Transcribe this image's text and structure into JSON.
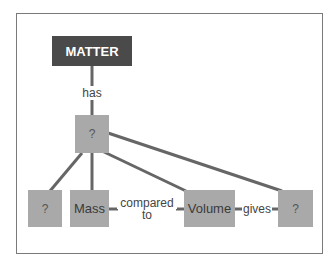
{
  "diagram": {
    "type": "concept-map",
    "nodes": {
      "matter": "MATTER",
      "property": "?",
      "left_unknown": "?",
      "mass": "Mass",
      "volume": "Volume",
      "result": "?"
    },
    "links": {
      "has": "has",
      "compared_to_line1": "compared",
      "compared_to_line2": "to",
      "gives": "gives"
    },
    "colors": {
      "dark_node": "#4a4a4a",
      "light_node": "#a9a9a9",
      "line": "#666666"
    }
  }
}
